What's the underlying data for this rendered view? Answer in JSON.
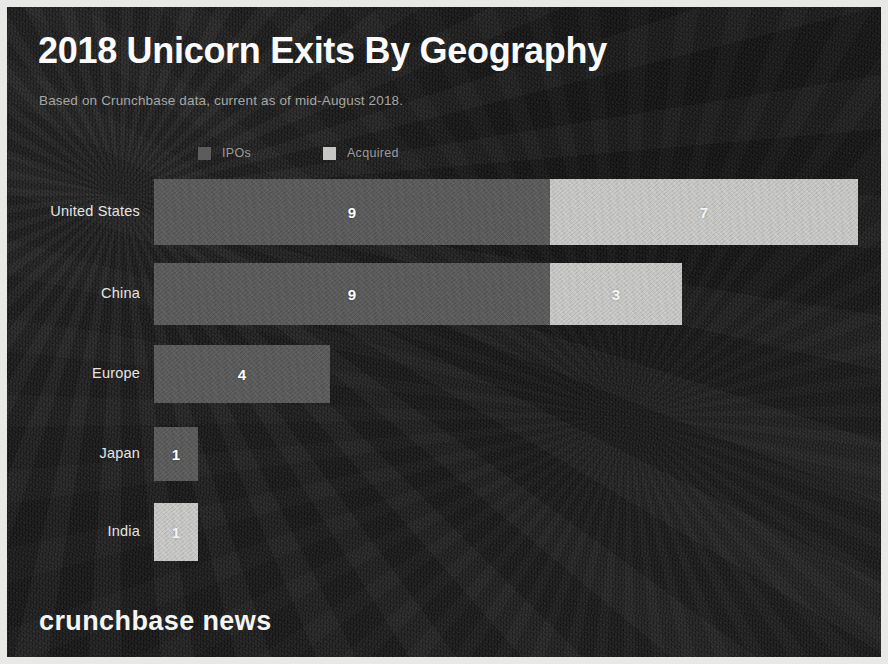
{
  "header": {
    "title": "2018 Unicorn Exits By Geography",
    "subtitle": "Based on Crunchbase data, current as of mid-August 2018."
  },
  "brand": {
    "text": "crunchbase news"
  },
  "legend": {
    "position": "top-left",
    "items": [
      {
        "label": "IPOs",
        "color": "#5c5c5c",
        "swatch_icon": "legend-swatch-square"
      },
      {
        "label": "Acquired",
        "color": "#c6c6c4",
        "swatch_icon": "legend-swatch-square"
      }
    ]
  },
  "theme": {
    "background": "#1c1c1c",
    "frame_border": "#e8e8e6",
    "title_color": "#fbfbfb",
    "subtitle_color": "#a7a7a5",
    "label_color": "#e4e4e2"
  },
  "chart_data": {
    "type": "bar",
    "orientation": "horizontal",
    "stacked": true,
    "title": "2018 Unicorn Exits By Geography",
    "subtitle": "Based on Crunchbase data, current as of mid-August 2018.",
    "xlabel": "",
    "ylabel": "",
    "grid": false,
    "legend_position": "top-left",
    "xlim": [
      0,
      16
    ],
    "px_per_unit": 44,
    "categories": [
      "United States",
      "China",
      "Europe",
      "Japan",
      "India"
    ],
    "series": [
      {
        "name": "IPOs",
        "color": "#5c5c5c",
        "values": [
          9,
          9,
          4,
          1,
          0
        ]
      },
      {
        "name": "Acquired",
        "color": "#c6c6c4",
        "values": [
          7,
          3,
          0,
          0,
          1
        ]
      }
    ],
    "totals": [
      16,
      12,
      4,
      1,
      1
    ],
    "rows": [
      {
        "category": "United States",
        "segments": [
          {
            "series": "IPOs",
            "value": 9,
            "label": "9",
            "color": "#5c5c5c"
          },
          {
            "series": "Acquired",
            "value": 7,
            "label": "7",
            "color": "#c6c6c4"
          }
        ]
      },
      {
        "category": "China",
        "segments": [
          {
            "series": "IPOs",
            "value": 9,
            "label": "9",
            "color": "#5c5c5c"
          },
          {
            "series": "Acquired",
            "value": 3,
            "label": "3",
            "color": "#c6c6c4"
          }
        ]
      },
      {
        "category": "Europe",
        "segments": [
          {
            "series": "IPOs",
            "value": 4,
            "label": "4",
            "color": "#5c5c5c"
          }
        ]
      },
      {
        "category": "Japan",
        "segments": [
          {
            "series": "IPOs",
            "value": 1,
            "label": "1",
            "color": "#5c5c5c"
          }
        ]
      },
      {
        "category": "India",
        "segments": [
          {
            "series": "Acquired",
            "value": 1,
            "label": "1",
            "color": "#c6c6c4"
          }
        ]
      }
    ]
  }
}
